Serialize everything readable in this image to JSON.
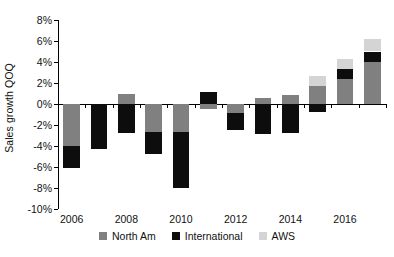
{
  "chart_data": {
    "type": "bar",
    "subtype": "stacked-bar",
    "title": "",
    "xlabel": "",
    "ylabel": "Sales growth QOQ",
    "ylim": [
      -10,
      8
    ],
    "ytick_values": [
      8,
      6,
      4,
      2,
      0,
      -2,
      -4,
      -6,
      -8,
      -10
    ],
    "ytick_labels": [
      "8%",
      "6%",
      "4%",
      "2%",
      "0%",
      "-2%",
      "-4%",
      "-6%",
      "-8%",
      "-10%"
    ],
    "grid": false,
    "legend_position": "bottom",
    "categories": [
      2006,
      2007,
      2008,
      2009,
      2010,
      2011,
      2012,
      2013,
      2014,
      2015,
      2016,
      2017
    ],
    "xtick_labels": [
      "2006",
      "2008",
      "2010",
      "2012",
      "2014",
      "2016"
    ],
    "xtick_categories": [
      2006,
      2008,
      2010,
      2012,
      2014,
      2016
    ],
    "series": [
      {
        "name": "North Am",
        "color": "#808080",
        "values": [
          -4.0,
          0.0,
          1.0,
          -2.7,
          -2.7,
          -0.5,
          -0.9,
          0.6,
          0.9,
          1.7,
          2.4,
          4.0
        ]
      },
      {
        "name": "International",
        "color": "#0d0d0d",
        "values": [
          -2.1,
          -4.3,
          -1.8,
          -2.1,
          -5.3,
          1.1,
          -1.6,
          -3.5,
          -3.6,
          -1.5,
          0.9,
          1.0
        ]
      },
      {
        "name": "AWS",
        "color": "#d4d4d4",
        "values": [
          0.0,
          0.0,
          0.0,
          0.0,
          0.0,
          0.0,
          0.0,
          0.0,
          0.0,
          1.0,
          1.0,
          1.2
        ]
      }
    ],
    "stack_segments": [
      {
        "year": 2006,
        "north_from": 0.0,
        "north_to": -4.0,
        "intl_from": -4.0,
        "intl_to": -6.1,
        "aws_from": 0,
        "aws_to": 0
      },
      {
        "year": 2007,
        "north_from": 0.0,
        "north_to": 0.0,
        "intl_from": 0.0,
        "intl_to": -4.3,
        "aws_from": 0,
        "aws_to": 0
      },
      {
        "year": 2008,
        "north_from": 0.0,
        "north_to": 1.0,
        "intl_from": 0.0,
        "intl_to": -2.8,
        "aws_from": 0,
        "aws_to": 0
      },
      {
        "year": 2009,
        "north_from": 0.0,
        "north_to": -2.7,
        "intl_from": -2.7,
        "intl_to": -4.8,
        "aws_from": 0,
        "aws_to": 0
      },
      {
        "year": 2010,
        "north_from": 0.0,
        "north_to": -2.7,
        "intl_from": -2.7,
        "intl_to": -8.0,
        "aws_from": 0,
        "aws_to": 0
      },
      {
        "year": 2011,
        "north_from": 0.0,
        "north_to": -0.5,
        "intl_from": 0.0,
        "intl_to": 1.1,
        "aws_from": 0,
        "aws_to": 0
      },
      {
        "year": 2012,
        "north_from": 0.0,
        "north_to": -0.9,
        "intl_from": -0.9,
        "intl_to": -2.5,
        "aws_from": 0,
        "aws_to": 0
      },
      {
        "year": 2013,
        "north_from": 0.0,
        "north_to": 0.6,
        "intl_from": 0.0,
        "intl_to": -2.9,
        "aws_from": 0,
        "aws_to": 0
      },
      {
        "year": 2014,
        "north_from": 0.0,
        "north_to": 0.9,
        "intl_from": 0.0,
        "intl_to": -2.8,
        "aws_from": 0,
        "aws_to": 0
      },
      {
        "year": 2015,
        "north_from": 0.0,
        "north_to": 1.7,
        "intl_from": 0.0,
        "intl_to": -0.8,
        "aws_from": 1.7,
        "aws_to": 2.7
      },
      {
        "year": 2016,
        "north_from": 0.0,
        "north_to": 2.4,
        "intl_from": 2.4,
        "intl_to": 3.3,
        "aws_from": 3.3,
        "aws_to": 4.3
      },
      {
        "year": 2017,
        "north_from": 0.0,
        "north_to": 4.0,
        "intl_from": 4.0,
        "intl_to": 5.0,
        "aws_from": 5.0,
        "aws_to": 6.2
      }
    ],
    "legend": [
      {
        "label": "North Am",
        "color": "#808080"
      },
      {
        "label": "International",
        "color": "#0d0d0d"
      },
      {
        "label": "AWS",
        "color": "#d4d4d4"
      }
    ]
  }
}
